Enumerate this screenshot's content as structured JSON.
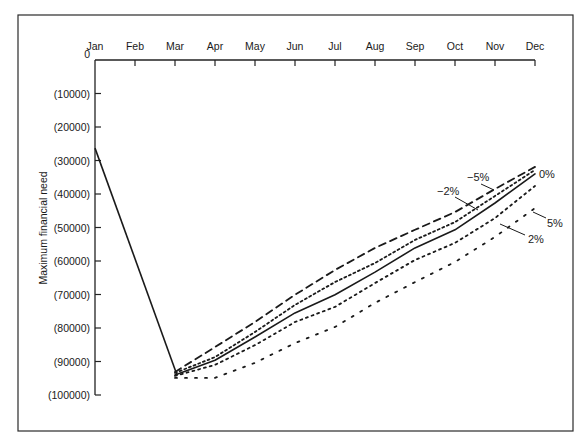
{
  "chart_data": {
    "type": "line",
    "title": "",
    "xlabel": "",
    "ylabel": "Maximum financial need",
    "x": [
      "Jan",
      "Feb",
      "Mar",
      "Apr",
      "May",
      "Jun",
      "Jul",
      "Aug",
      "Sep",
      "Oct",
      "Nov",
      "Dec"
    ],
    "ylim": [
      -100000,
      0
    ],
    "yticks": [
      0,
      -10000,
      -20000,
      -30000,
      -40000,
      -50000,
      -60000,
      -70000,
      -80000,
      -90000,
      -100000
    ],
    "ytick_labels": [
      "0",
      "(10000)",
      "(20000)",
      "(30000)",
      "(40000)",
      "(50000)",
      "(60000)",
      "(70000)",
      "(80000)",
      "(90000)",
      "(100000)"
    ],
    "grid": false,
    "legend_position": "inline labels at right end of lines",
    "series": [
      {
        "name": "-5%",
        "label": "−5%",
        "style": "dashed",
        "values": [
          -26300,
          null,
          -93100,
          -85700,
          -78200,
          -70100,
          -62700,
          -56100,
          -50700,
          -45400,
          -38500,
          -31900
        ]
      },
      {
        "name": "-2%",
        "label": "−2%",
        "style": "dotted-fine",
        "values": [
          -26300,
          null,
          -93400,
          -88700,
          -81200,
          -73100,
          -66300,
          -60600,
          -53700,
          -48400,
          -40600,
          -32800
        ]
      },
      {
        "name": "0%",
        "label": "0%",
        "style": "solid",
        "values": [
          -26300,
          null,
          -94000,
          -89600,
          -82700,
          -75500,
          -70100,
          -63300,
          -56100,
          -50700,
          -42700,
          -34000
        ]
      },
      {
        "name": "2%",
        "label": "2%",
        "style": "dotted",
        "values": [
          -26300,
          null,
          -94300,
          -91000,
          -85100,
          -78200,
          -73700,
          -66600,
          -59700,
          -54600,
          -47200,
          -37600
        ]
      },
      {
        "name": "5%",
        "label": "5%",
        "style": "dotted-sparse",
        "values": [
          -26300,
          null,
          -94900,
          -94900,
          -90400,
          -84500,
          -79700,
          -72500,
          -66300,
          -60300,
          -52800,
          -44200
        ]
      }
    ],
    "annotations": [
      {
        "text": "−5%",
        "target_series": "-5%"
      },
      {
        "text": "−2%",
        "target_series": "-2%"
      },
      {
        "text": "0%",
        "target_series": "0%"
      },
      {
        "text": "2%",
        "target_series": "2%"
      },
      {
        "text": "5%",
        "target_series": "5%"
      }
    ]
  },
  "labels": {
    "ylabel": "Maximum financial need"
  }
}
